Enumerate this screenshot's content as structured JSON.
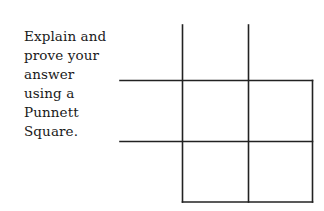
{
  "instructions": {
    "lines": [
      "Explain and",
      "prove your",
      "answer",
      "using a",
      "Punnett",
      "Square."
    ]
  },
  "punnett_square": {
    "rows": 2,
    "cols": 2,
    "cells": [
      [
        "",
        ""
      ],
      [
        "",
        ""
      ]
    ],
    "header_row": [
      "",
      ""
    ],
    "header_col": [
      "",
      ""
    ],
    "line_color": "#222222"
  }
}
